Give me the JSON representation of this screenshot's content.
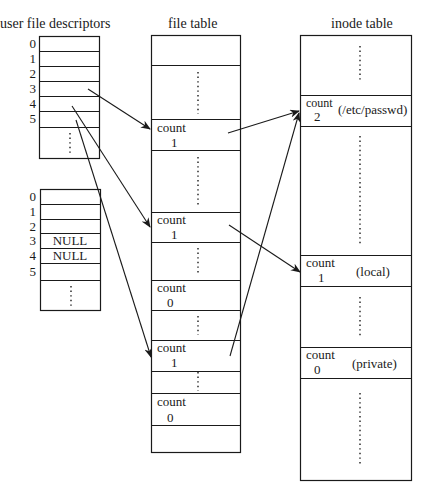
{
  "titles": {
    "user_fd": "user file descriptors",
    "file_table": "file table",
    "inode_table": "inode table"
  },
  "ufd_tables": [
    {
      "indices": [
        "0",
        "1",
        "2",
        "3",
        "4",
        "5"
      ],
      "entries": [
        "",
        "",
        "",
        "",
        "",
        ""
      ],
      "continuation": "⋮"
    },
    {
      "indices": [
        "0",
        "1",
        "2",
        "3",
        "4",
        "5"
      ],
      "entries": [
        "",
        "",
        "",
        "NULL",
        "NULL",
        ""
      ],
      "continuation": "⋮"
    }
  ],
  "file_table": {
    "entries": [
      {
        "label": "count",
        "value": "1"
      },
      {
        "label": "count",
        "value": "1"
      },
      {
        "label": "count",
        "value": "0"
      },
      {
        "label": "count",
        "value": "1"
      },
      {
        "label": "count",
        "value": "0"
      }
    ]
  },
  "inode_table": {
    "entries": [
      {
        "label": "count",
        "value": "2",
        "name": "(/etc/passwd)"
      },
      {
        "label": "count",
        "value": "1",
        "name": "(local)"
      },
      {
        "label": "count",
        "value": "0",
        "name": "(private)"
      }
    ]
  },
  "arrows": [
    {
      "from": "ufd1[3]",
      "to": "file_table[0]"
    },
    {
      "from": "ufd1[4]",
      "to": "file_table[1]"
    },
    {
      "from": "ufd1[5]",
      "to": "file_table[3]"
    },
    {
      "from": "file_table[0]",
      "to": "inode_table[0]"
    },
    {
      "from": "file_table[1]",
      "to": "inode_table[1]"
    },
    {
      "from": "file_table[3]",
      "to": "inode_table[0]"
    }
  ]
}
